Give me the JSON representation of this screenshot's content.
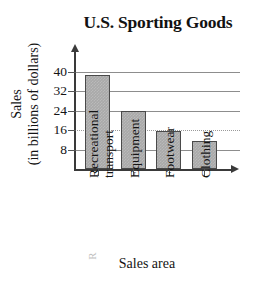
{
  "chart_data": {
    "type": "bar",
    "title": "U.S. Sporting Goods",
    "xlabel": "Sales area",
    "ylabel_line1": "Sales",
    "ylabel_line2": "(in billions of dollars)",
    "categories": [
      "Recreational transport",
      "Equipment",
      "Footwear",
      "Clothing"
    ],
    "category_lines": [
      [
        "Recreational",
        "transport"
      ],
      [
        "Equipment"
      ],
      [
        "Footwear"
      ],
      [
        "Clothing"
      ]
    ],
    "values": [
      38.5,
      24,
      15.5,
      11.5
    ],
    "yticks": [
      8,
      16,
      24,
      32,
      40
    ],
    "ylim": [
      0,
      44
    ],
    "grid": true,
    "legend": "none",
    "bar_fill": "#a9a9a9",
    "bar_border": "#4a4a4a",
    "axis_color": "#3a3a3a",
    "grid_color": "#8d8d8d"
  },
  "artifacts": {
    "top_left": "",
    "bottom_left": "R"
  }
}
